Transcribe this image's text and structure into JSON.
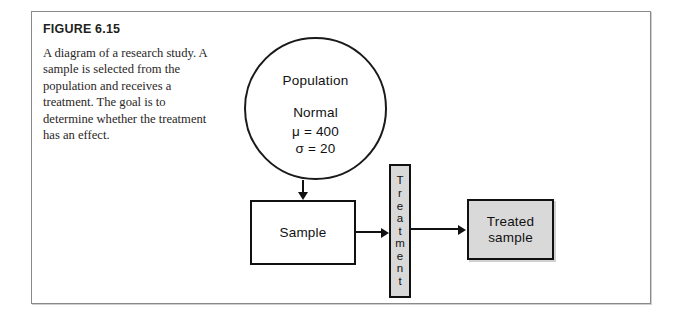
{
  "figure": {
    "number_label": "FIGURE 6.15",
    "caption": "A diagram of a research study. A sample is selected from the population and receives a treatment. The goal is to determine whether the treatment has an effect."
  },
  "diagram": {
    "population": {
      "title": "Population",
      "distribution": "Normal",
      "mean": "μ = 400",
      "sd": "σ = 20"
    },
    "sample_box": {
      "label": "Sample"
    },
    "treatment_bar": {
      "label": "Treatment",
      "letters": [
        "T",
        "r",
        "e",
        "a",
        "t",
        "m",
        "e",
        "n",
        "t"
      ]
    },
    "treated_sample_box": {
      "line1": "Treated",
      "line2": "sample"
    },
    "arrows": [
      {
        "name": "population-to-sample",
        "direction": "down"
      },
      {
        "name": "sample-to-treatment",
        "direction": "right"
      },
      {
        "name": "treatment-to-treated-sample",
        "direction": "right"
      }
    ]
  },
  "colors": {
    "fill_gray": "#d9d9d9",
    "stroke_black": "#111111",
    "frame_border": "#8a8a8a",
    "text_dark": "#231f20"
  }
}
